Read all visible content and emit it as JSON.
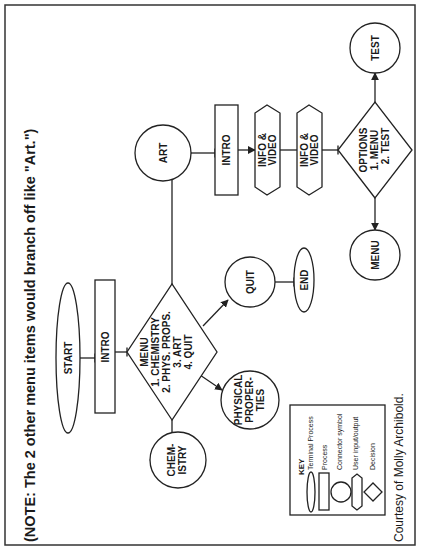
{
  "note": "(NOTE: The 2 other menu items would branch off like \"Art.\")",
  "nodes": {
    "start": {
      "type": "terminal",
      "label": "START"
    },
    "intro_main": {
      "type": "process",
      "label": "INTRO"
    },
    "menu_decision": {
      "type": "decision",
      "lines": [
        "MENU",
        "1. CHEMISTRY",
        "2. PHYS. PROPS.",
        "3. ART",
        "4. QUIT"
      ]
    },
    "chemistry": {
      "type": "connector",
      "lines": [
        "CHEM-",
        "ISTRY"
      ]
    },
    "physical_properties": {
      "type": "connector",
      "lines": [
        "PHYSICAL",
        "PROPER-",
        "TIES"
      ]
    },
    "quit": {
      "type": "connector",
      "label": "QUIT"
    },
    "end": {
      "type": "terminal",
      "label": "END"
    },
    "art": {
      "type": "connector",
      "label": "ART"
    },
    "intro_art": {
      "type": "process",
      "label": "INTRO"
    },
    "info_video_1": {
      "type": "user_io",
      "lines": [
        "INFO &",
        "VIDEO"
      ]
    },
    "info_video_2": {
      "type": "user_io",
      "lines": [
        "INFO &",
        "VIDEO"
      ]
    },
    "options_decision": {
      "type": "decision",
      "lines": [
        "OPTIONS",
        "1. MENU",
        "2. TEST"
      ]
    },
    "test": {
      "type": "connector",
      "label": "TEST"
    },
    "menu_return": {
      "type": "connector",
      "label": "MENU"
    }
  },
  "edges": [
    [
      "start",
      "intro_main"
    ],
    [
      "intro_main",
      "menu_decision"
    ],
    [
      "menu_decision",
      "chemistry"
    ],
    [
      "menu_decision",
      "physical_properties"
    ],
    [
      "menu_decision",
      "quit"
    ],
    [
      "menu_decision",
      "art"
    ],
    [
      "quit",
      "end"
    ],
    [
      "art",
      "intro_art"
    ],
    [
      "intro_art",
      "info_video_1"
    ],
    [
      "info_video_1",
      "info_video_2"
    ],
    [
      "info_video_2",
      "options_decision"
    ],
    [
      "options_decision",
      "test"
    ],
    [
      "options_decision",
      "menu_return"
    ]
  ],
  "key": {
    "title": "KEY",
    "items": [
      {
        "shape": "ellipse",
        "label": "Terminal Process"
      },
      {
        "shape": "rectangle",
        "label": "Process"
      },
      {
        "shape": "circle",
        "label": "Connector symbol"
      },
      {
        "shape": "hexagon",
        "label": "User input/output"
      },
      {
        "shape": "diamond",
        "label": "Decision"
      }
    ]
  },
  "credit": "Courtesy of Molly Archibold."
}
